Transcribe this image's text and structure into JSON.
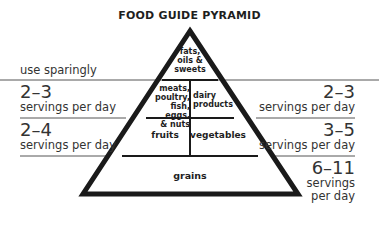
{
  "title": "FOOD GUIDE PYRAMID",
  "levels": {
    "top": {
      "label": "fats, oils & sweets",
      "lines": [
        "fats,",
        "oils &",
        "sweets"
      ],
      "guide": "use sparingly"
    },
    "protein": {
      "lines": [
        "meats,",
        "poultry,",
        "fish, eggs,",
        "& nuts"
      ],
      "servings": "2–3",
      "unit": "servings per day"
    },
    "dairy": {
      "lines": [
        "dairy",
        "products"
      ],
      "servings": "2–3",
      "unit": "servings per day"
    },
    "fruits": {
      "label": "fruits",
      "servings": "2–4",
      "unit": "servings per day"
    },
    "vegetables": {
      "label": "vegetables",
      "servings": "3–5",
      "unit": "servings per day"
    },
    "grains": {
      "label": "grains",
      "servings": "6–11",
      "unit_lines": [
        "servings",
        "per day"
      ]
    }
  }
}
